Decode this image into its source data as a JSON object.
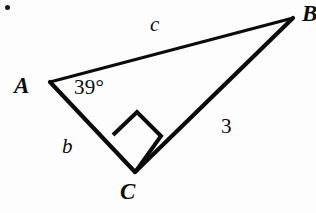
{
  "figure": {
    "type": "geometry-diagram",
    "shape": "right-triangle",
    "background_color": "#fdfdfd",
    "ink_color": "#0b0b0b"
  },
  "vertices": {
    "a": {
      "label": "A",
      "x": 50,
      "y": 82
    },
    "b": {
      "label": "B",
      "x": 293,
      "y": 18
    },
    "c": {
      "label": "C",
      "x": 135,
      "y": 172
    }
  },
  "sides": {
    "ab": {
      "label": "c",
      "from": "A",
      "to": "B",
      "role": "hypotenuse"
    },
    "ac": {
      "label": "b",
      "from": "A",
      "to": "C",
      "role": "leg"
    },
    "bc": {
      "label": "3",
      "from": "B",
      "to": "C",
      "role": "leg"
    }
  },
  "angles": {
    "at_a": {
      "label": "39°",
      "value": 39,
      "unit": "degrees"
    },
    "at_c": {
      "label": "",
      "value": 90,
      "unit": "degrees",
      "marker": "right-angle-square"
    }
  },
  "artifacts": {
    "scan_dot": {
      "name": "scan-dot",
      "x": 8,
      "y": 8
    }
  }
}
